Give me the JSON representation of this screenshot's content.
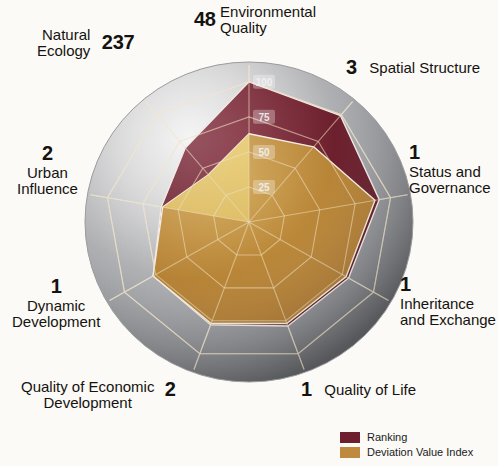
{
  "chart_data": {
    "type": "radar",
    "title": "",
    "categories": [
      "Environmental Quality",
      "Spatial Structure",
      "Status and Governance",
      "Inheritance and Exchange",
      "Quality of Life",
      "Quality of Economic Development",
      "Dynamic Development",
      "Urban Influence",
      "Natural Ecology"
    ],
    "rankings": [
      48,
      3,
      1,
      1,
      1,
      2,
      1,
      2,
      237
    ],
    "radial_ticks": [
      25,
      50,
      75,
      100
    ],
    "rmin": 0,
    "rmax": 112,
    "grid": true,
    "legend_position": "bottom-right",
    "series": [
      {
        "name": "Ranking",
        "color": "#6d1f2d",
        "values": [
          100,
          99,
          92,
          80,
          79,
          78,
          77,
          62,
          69
        ]
      },
      {
        "name": "Deviation Value Index",
        "color": "#b98537",
        "values": [
          63,
          70,
          89,
          78,
          77,
          77,
          77,
          61,
          44
        ]
      }
    ]
  },
  "axes": [
    {
      "rank": "48",
      "name": "Environmental\nQuality"
    },
    {
      "rank": "3",
      "name": "Spatial Structure"
    },
    {
      "rank": "1",
      "name": "Status and\nGovernance"
    },
    {
      "rank": "1",
      "name": "Inheritance\nand Exchange"
    },
    {
      "rank": "1",
      "name": "Quality of Life"
    },
    {
      "rank": "2",
      "name": "Quality of Economic\nDevelopment"
    },
    {
      "rank": "1",
      "name": "Dynamic\nDevelopment"
    },
    {
      "rank": "2",
      "name": "Urban\nInfluence"
    },
    {
      "rank": "237",
      "name": "Natural\nEcology"
    }
  ],
  "radial_tick_labels": {
    "t100": "100",
    "t75": "75",
    "t50": "50",
    "t25": "25"
  },
  "legend": {
    "items": [
      {
        "label": "Ranking",
        "color": "#6d1f2d"
      },
      {
        "label": "Deviation Value Index",
        "color": "#c08a3e"
      }
    ]
  },
  "colors": {
    "ranking": "#6d1f2d",
    "deviation": "#b98537",
    "deviation_highlight": "#d9b457",
    "sphere_light": "#e9e9e9",
    "sphere_dark": "#6f7073",
    "grid_line": "#e6d9b8",
    "text": "#1a1a1a"
  }
}
